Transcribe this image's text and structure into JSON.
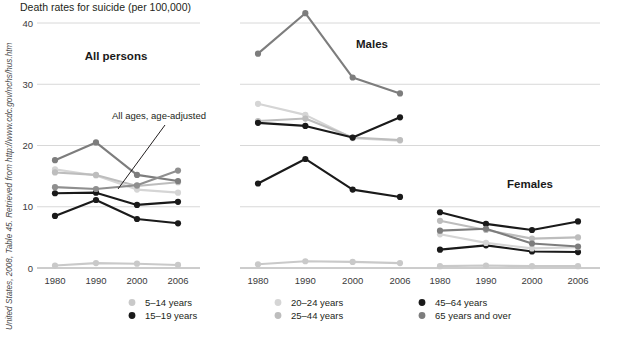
{
  "header": {
    "axis_title": "Death rates for suicide (per 100,000)"
  },
  "side_note": {
    "text": "United States, 2008, Table 45.  Retrieved from http://www.cdc.gov/nchs/hus.htm"
  },
  "annotation": {
    "label": "All ages, age-adjusted"
  },
  "panels": [
    {
      "title": "All persons"
    },
    {
      "title": "Males"
    },
    {
      "title": "Females"
    }
  ],
  "legend": {
    "items": [
      {
        "label": "5–14 years",
        "color": "#c9c9c9"
      },
      {
        "label": "15–19 years",
        "color": "#1a1a1a"
      },
      {
        "label": "20–24 years",
        "color": "#d5d5d5"
      },
      {
        "label": "25–44 years",
        "color": "#bdbdbd"
      },
      {
        "label": "45–64 years",
        "color": "#1a1a1a"
      },
      {
        "label": "65 years and over",
        "color": "#7d7d7d"
      }
    ]
  },
  "axes": {
    "y_ticks": [
      "0",
      "10",
      "20",
      "30",
      "40"
    ],
    "y_tick_values": [
      0,
      10,
      20,
      30,
      40
    ],
    "x_ticks": [
      "1980",
      "1990",
      "2000",
      "2006"
    ],
    "x_tick_values": [
      1980,
      1990,
      2000,
      2006
    ],
    "ylim": [
      0,
      40
    ],
    "grid": true
  },
  "chart_data": {
    "type": "line",
    "title": "Death rates for suicide (per 100,000)",
    "xlabel": "",
    "ylabel": "Death rates for suicide (per 100,000)",
    "ylim": [
      0,
      40
    ],
    "x": [
      1980,
      1990,
      2000,
      2006
    ],
    "xlabels": [
      "1980",
      "1990",
      "2000",
      "2006"
    ],
    "grid": true,
    "legend_position": "bottom",
    "annotations": [
      {
        "text": "All ages, age-adjusted",
        "panel": "All persons",
        "points_to_series": "All ages, age-adjusted"
      }
    ],
    "panels": [
      {
        "name": "All persons",
        "series": [
          {
            "name": "5–14 years",
            "color": "#c9c9c9",
            "values": [
              0.4,
              0.8,
              0.7,
              0.5
            ]
          },
          {
            "name": "15–19 years",
            "color": "#1a1a1a",
            "values": [
              8.5,
              11.1,
              8.0,
              7.3
            ]
          },
          {
            "name": "20–24 years",
            "color": "#d5d5d5",
            "values": [
              16.1,
              15.1,
              12.8,
              12.3
            ]
          },
          {
            "name": "25–44 years",
            "color": "#bdbdbd",
            "values": [
              15.6,
              15.2,
              13.4,
              14.0
            ]
          },
          {
            "name": "45–64 years",
            "color": "#1a1a1a",
            "values": [
              12.2,
              12.3,
              10.3,
              10.8
            ]
          },
          {
            "name": "65 years and over",
            "color": "#7d7d7d",
            "values": [
              17.6,
              20.5,
              15.2,
              14.2
            ]
          },
          {
            "name": "All ages, age-adjusted",
            "color": "#8f8f8f",
            "values": [
              13.2,
              12.9,
              13.5,
              15.9
            ]
          }
        ]
      },
      {
        "name": "Males",
        "series": [
          {
            "name": "5–14 years",
            "color": "#c9c9c9",
            "values": [
              0.6,
              1.1,
              1.0,
              0.8
            ]
          },
          {
            "name": "15–19 years",
            "color": "#1a1a1a",
            "values": [
              13.8,
              17.8,
              12.8,
              11.6
            ]
          },
          {
            "name": "20–24 years",
            "color": "#d5d5d5",
            "values": [
              26.8,
              25.0,
              21.2,
              20.8
            ]
          },
          {
            "name": "25–44 years",
            "color": "#bdbdbd",
            "values": [
              24.0,
              24.4,
              21.3,
              20.9
            ]
          },
          {
            "name": "45–64 years",
            "color": "#1a1a1a",
            "values": [
              23.7,
              23.2,
              21.3,
              24.6
            ]
          },
          {
            "name": "65 years and over",
            "color": "#7d7d7d",
            "values": [
              35.0,
              41.6,
              31.1,
              28.5
            ]
          }
        ]
      },
      {
        "name": "Females",
        "series": [
          {
            "name": "5–14 years",
            "color": "#c9c9c9",
            "values": [
              0.3,
              0.4,
              0.3,
              0.3
            ]
          },
          {
            "name": "15–19 years",
            "color": "#1a1a1a",
            "values": [
              3.0,
              3.7,
              2.7,
              2.6
            ]
          },
          {
            "name": "20–24 years",
            "color": "#d5d5d5",
            "values": [
              5.5,
              4.1,
              3.2,
              3.4
            ]
          },
          {
            "name": "25–44 years",
            "color": "#bdbdbd",
            "values": [
              7.7,
              6.2,
              4.8,
              5.0
            ]
          },
          {
            "name": "45–64 years",
            "color": "#1a1a1a",
            "values": [
              9.1,
              7.2,
              6.2,
              7.6
            ]
          },
          {
            "name": "65 years and over",
            "color": "#7d7d7d",
            "values": [
              6.1,
              6.4,
              4.0,
              3.5
            ]
          }
        ]
      }
    ]
  }
}
